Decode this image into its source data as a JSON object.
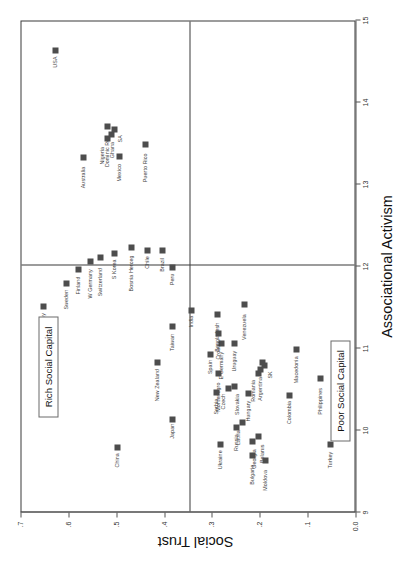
{
  "chart_data": {
    "type": "scatter",
    "title": "",
    "xlabel": "Associational Activism",
    "ylabel": "Social Trust",
    "xlim": [
      9,
      15
    ],
    "ylim": [
      0.0,
      0.7
    ],
    "xticks": [
      "9",
      "10",
      "11",
      "12",
      "13",
      "14",
      "15"
    ],
    "yticks": [
      "0.0",
      ".1",
      ".2",
      ".3",
      ".4",
      ".5",
      ".6",
      ".7"
    ],
    "grid": false,
    "legend": "none",
    "quadrant_divider_x": 12.0,
    "quadrant_divider_y": 0.35,
    "annotations": [
      {
        "name": "rich-social-capital",
        "text": "Rich Social Capital"
      },
      {
        "name": "poor-social-capital",
        "text": "Poor Social Capital"
      }
    ],
    "points": [
      {
        "label": "China",
        "x": 9.78,
        "y": 0.5,
        "lx": -20,
        "ly": -1
      },
      {
        "label": "Japan",
        "x": 10.12,
        "y": 0.385,
        "lx": -19,
        "ly": -1
      },
      {
        "label": "New Zealand",
        "x": 10.82,
        "y": 0.415,
        "lx": -39,
        "ly": -1
      },
      {
        "label": "Taiwan",
        "x": 11.25,
        "y": 0.385,
        "lx": -24,
        "ly": -1
      },
      {
        "label": "India",
        "x": 11.45,
        "y": 0.345,
        "lx": -17,
        "ly": -1
      },
      {
        "label": "Norway",
        "x": 11.5,
        "y": 0.655,
        "lx": -25,
        "ly": -1
      },
      {
        "label": "Sweden",
        "x": 11.78,
        "y": 0.605,
        "lx": -26,
        "ly": -1
      },
      {
        "label": "Finland",
        "x": 11.95,
        "y": 0.58,
        "lx": -25,
        "ly": -1
      },
      {
        "label": "W Germany",
        "x": 12.05,
        "y": 0.555,
        "lx": -37,
        "ly": -1
      },
      {
        "label": "Switzerland",
        "x": 12.1,
        "y": 0.535,
        "lx": -39,
        "ly": -1
      },
      {
        "label": "S Korea",
        "x": 12.15,
        "y": 0.505,
        "lx": -26,
        "ly": -1
      },
      {
        "label": "Bosnia Herceg",
        "x": 12.22,
        "y": 0.47,
        "lx": -44,
        "ly": -1
      },
      {
        "label": "Chile",
        "x": 12.18,
        "y": 0.437,
        "lx": -18,
        "ly": -1
      },
      {
        "label": "Australia",
        "x": 13.32,
        "y": 0.57,
        "lx": -31,
        "ly": -1
      },
      {
        "label": "Mexico",
        "x": 13.33,
        "y": 0.495,
        "lx": -25,
        "ly": -1
      },
      {
        "label": "Dominic Rep",
        "x": 13.7,
        "y": 0.52,
        "lx": -41,
        "ly": -1
      },
      {
        "label": "USA",
        "x": 14.62,
        "y": 0.63,
        "lx": -17,
        "ly": -1
      },
      {
        "label": "Nigeria",
        "x": 13.55,
        "y": 0.52,
        "lx": -26,
        "ly": -6
      },
      {
        "label": "Ghana",
        "x": 13.6,
        "y": 0.512,
        "lx": -24,
        "ly": 0
      },
      {
        "label": "SA",
        "x": 13.66,
        "y": 0.506,
        "lx": -13,
        "ly": 5
      },
      {
        "label": "Puerto Rico",
        "x": 13.48,
        "y": 0.44,
        "lx": -38,
        "ly": -1
      },
      {
        "label": "Brazil",
        "x": 12.18,
        "y": 0.405,
        "lx": -21,
        "ly": -1
      },
      {
        "label": "Peru",
        "x": 11.98,
        "y": 0.385,
        "lx": -18,
        "ly": -1
      },
      {
        "label": "Bangladesh",
        "x": 11.4,
        "y": 0.29,
        "lx": -37,
        "ly": -1
      },
      {
        "label": "Venezuela",
        "x": 11.52,
        "y": 0.235,
        "lx": -35,
        "ly": -1
      },
      {
        "label": "Spain",
        "x": 10.92,
        "y": 0.305,
        "lx": -20,
        "ly": -1
      },
      {
        "label": "E Germany",
        "x": 11.05,
        "y": 0.283,
        "lx": -36,
        "ly": -1
      },
      {
        "label": "Croatia",
        "x": 11.17,
        "y": 0.288,
        "lx": -26,
        "ly": -1
      },
      {
        "label": "Uruguay",
        "x": 11.05,
        "y": 0.255,
        "lx": -28,
        "ly": -1
      },
      {
        "label": "Montenegro",
        "x": 10.68,
        "y": 0.288,
        "lx": -38,
        "ly": -1
      },
      {
        "label": "Serbia",
        "x": 10.45,
        "y": 0.293,
        "lx": -22,
        "ly": -1
      },
      {
        "label": "Czech",
        "x": 10.5,
        "y": 0.268,
        "lx": -21,
        "ly": -6
      },
      {
        "label": "Slovakia",
        "x": 10.52,
        "y": 0.255,
        "lx": -28,
        "ly": 2
      },
      {
        "label": "Hungary",
        "x": 10.44,
        "y": 0.225,
        "lx": -28,
        "ly": -1
      },
      {
        "label": "Romania",
        "x": 10.68,
        "y": 0.205,
        "lx": -28,
        "ly": -6
      },
      {
        "label": "Argentina",
        "x": 10.73,
        "y": 0.2,
        "lx": -31,
        "ly": -1
      },
      {
        "label": "SK",
        "x": 10.78,
        "y": 0.192,
        "lx": -13,
        "ly": 5
      },
      {
        "label": "China2",
        "x": 10.82,
        "y": 0.197,
        "lx": -99,
        "ly": -1
      },
      {
        "label": "Colombia",
        "x": 10.42,
        "y": 0.14,
        "lx": -29,
        "ly": -1
      },
      {
        "label": "Macedonia",
        "x": 10.98,
        "y": 0.125,
        "lx": -34,
        "ly": -1
      },
      {
        "label": "Philippines",
        "x": 10.62,
        "y": 0.075,
        "lx": -36,
        "ly": -1
      },
      {
        "label": "Ukraine",
        "x": 9.82,
        "y": 0.285,
        "lx": -25,
        "ly": -1
      },
      {
        "label": "Russia",
        "x": 10.02,
        "y": 0.25,
        "lx": -23,
        "ly": -1
      },
      {
        "label": "Latvia",
        "x": 10.08,
        "y": 0.238,
        "lx": -22,
        "ly": -5
      },
      {
        "label": "Georgia",
        "x": 9.85,
        "y": 0.218,
        "lx": -27,
        "ly": 1
      },
      {
        "label": "Belarus",
        "x": 9.92,
        "y": 0.205,
        "lx": -27,
        "ly": 3
      },
      {
        "label": "Bulgaria",
        "x": 9.68,
        "y": 0.218,
        "lx": -29,
        "ly": -1
      },
      {
        "label": "Moldova",
        "x": 9.62,
        "y": 0.19,
        "lx": -30,
        "ly": -1
      },
      {
        "label": "Turkey",
        "x": 9.82,
        "y": 0.055,
        "lx": -24,
        "ly": -1
      }
    ]
  }
}
